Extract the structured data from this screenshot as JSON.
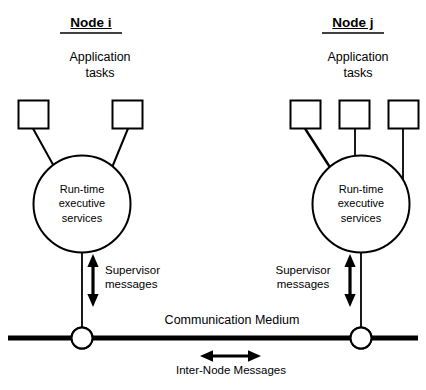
{
  "diagram": {
    "title_left": "Node i",
    "title_right": "Node j",
    "application_tasks_label": "Application\ntasks",
    "runtime_label_left": "Run-time\nexecutive\nservices",
    "runtime_label_right": "Run-time\nexecutive\nservices",
    "supervisor_label_left": "Supervisor\nmessages",
    "supervisor_label_right": "Supervisor\nmessages",
    "communication_medium_label": "Communication Medium",
    "internode_messages_label": "Inter-Node Messages",
    "left_node": {
      "title": "Node i",
      "tasks_label": "Application tasks",
      "task_box_count": 2,
      "runtime_lines": [
        "Run-time",
        "executive",
        "services"
      ],
      "supervisor_lines": [
        "Supervisor",
        "messages"
      ]
    },
    "right_node": {
      "title": "Node j",
      "tasks_label": "Application tasks",
      "task_box_count": 3,
      "runtime_lines": [
        "Run-time",
        "executive",
        "services"
      ],
      "supervisor_lines": [
        "Supervisor",
        "messages"
      ]
    },
    "bus": {
      "label": "Communication Medium",
      "message_label": "Inter-Node Messages"
    },
    "colors": {
      "stroke": "#000000",
      "background": "#ffffff",
      "text": "#000000"
    }
  }
}
